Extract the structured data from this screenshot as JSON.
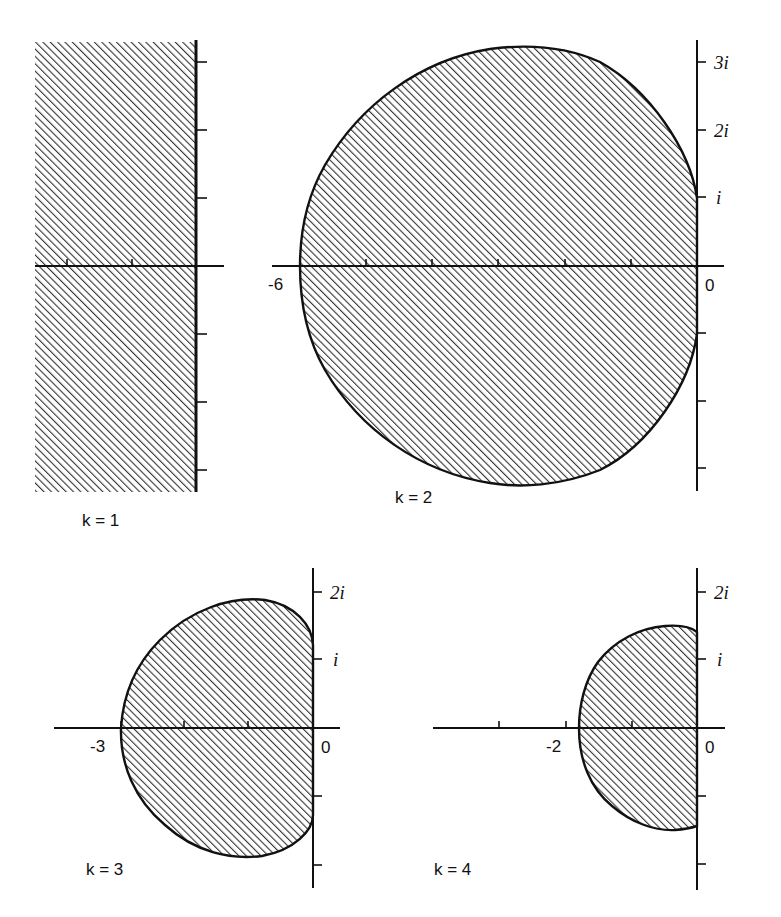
{
  "figure": {
    "panels": [
      {
        "id": "k1",
        "label": "k = 1",
        "region": "entire left half-plane (Re z <= 0)",
        "real_ticks": [
          -2,
          -1
        ],
        "imag_ticks": [
          3,
          2,
          1,
          -1,
          -2,
          -3
        ],
        "tick_labels": []
      },
      {
        "id": "k2",
        "label": "k = 2",
        "region": "closed disc-like region, leftmost point -6, max imag about 3.2, touches imaginary axis between -i and i",
        "real_tick_labels": [
          {
            "value": -6,
            "text": "-6"
          },
          {
            "value": 0,
            "text": "0"
          }
        ],
        "imag_tick_labels": [
          {
            "value": 3,
            "text": "3i"
          },
          {
            "value": 2,
            "text": "2i"
          },
          {
            "value": 1,
            "text": "i"
          }
        ],
        "real_ticks": [
          -6,
          -5,
          -4,
          -3,
          -2,
          -1,
          0
        ],
        "imag_ticks": [
          3,
          2,
          1,
          -1,
          -2,
          -3
        ]
      },
      {
        "id": "k3",
        "label": "k = 3",
        "region": "bounded region, leftmost point -3, max imag about 1.9, touches imaginary axis near +-1.25i",
        "real_tick_labels": [
          {
            "value": -3,
            "text": "-3"
          },
          {
            "value": 0,
            "text": "0"
          }
        ],
        "imag_tick_labels": [
          {
            "value": 2,
            "text": "2i"
          },
          {
            "value": 1,
            "text": "i"
          }
        ],
        "real_ticks": [
          -3,
          -2,
          -1,
          0
        ],
        "imag_ticks": [
          2,
          1,
          -1,
          -2
        ]
      },
      {
        "id": "k4",
        "label": "k = 4",
        "region": "bounded region, leftmost point about -1.8, max imag about 1.5, touches imaginary axis near +-1.45i",
        "real_tick_labels": [
          {
            "value": -2,
            "text": "-2"
          },
          {
            "value": 0,
            "text": "0"
          }
        ],
        "imag_tick_labels": [
          {
            "value": 2,
            "text": "2i"
          },
          {
            "value": 1,
            "text": "i"
          }
        ],
        "real_ticks": [
          -3,
          -2,
          -1,
          0
        ],
        "imag_ticks": [
          2,
          1,
          -1,
          -2
        ]
      }
    ],
    "colors": {
      "ink": "#111111",
      "hatch": "#333333",
      "background": "#ffffff"
    }
  },
  "labels": {
    "k1": "k = 1",
    "k2": "k = 2",
    "k3": "k = 3",
    "k4": "k = 4",
    "neg6": "-6",
    "zero": "0",
    "neg3": "-3",
    "neg2": "-2",
    "i3": "3i",
    "i2": "2i",
    "i1": "i"
  }
}
